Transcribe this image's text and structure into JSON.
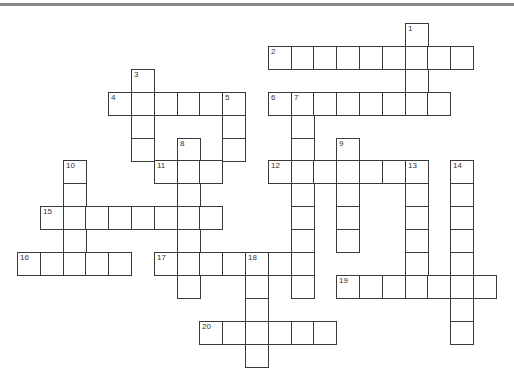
{
  "puzzle": {
    "grid": {
      "origin_x": 17,
      "origin_y": 23,
      "cell_w": 22.8,
      "cell_h": 22.9
    },
    "colors": {
      "border": "#3a3a3a",
      "background": "#ffffff",
      "top_rule": "#8a8a8a"
    },
    "entries": [
      {
        "number": "1",
        "direction": "down",
        "col": 17,
        "row": 0,
        "length": 4
      },
      {
        "number": "2",
        "direction": "across",
        "col": 11,
        "row": 1,
        "length": 9
      },
      {
        "number": "3",
        "direction": "down",
        "col": 5,
        "row": 2,
        "length": 4
      },
      {
        "number": "4",
        "direction": "across",
        "col": 4,
        "row": 3,
        "length": 6
      },
      {
        "number": "5",
        "direction": "down",
        "col": 9,
        "row": 3,
        "length": 3
      },
      {
        "number": "6",
        "direction": "across",
        "col": 11,
        "row": 3,
        "length": 8
      },
      {
        "number": "7",
        "direction": "down",
        "col": 12,
        "row": 3,
        "length": 9
      },
      {
        "number": "8",
        "direction": "down",
        "col": 7,
        "row": 5,
        "length": 7
      },
      {
        "number": "9",
        "direction": "down",
        "col": 14,
        "row": 5,
        "length": 5
      },
      {
        "number": "10",
        "direction": "down",
        "col": 2,
        "row": 6,
        "length": 5
      },
      {
        "number": "11",
        "direction": "across",
        "col": 6,
        "row": 6,
        "length": 3
      },
      {
        "number": "12",
        "direction": "across",
        "col": 11,
        "row": 6,
        "length": 7
      },
      {
        "number": "13",
        "direction": "down",
        "col": 17,
        "row": 6,
        "length": 6
      },
      {
        "number": "14",
        "direction": "down",
        "col": 19,
        "row": 6,
        "length": 8
      },
      {
        "number": "15",
        "direction": "across",
        "col": 1,
        "row": 8,
        "length": 8
      },
      {
        "number": "16",
        "direction": "across",
        "col": 0,
        "row": 10,
        "length": 5
      },
      {
        "number": "17",
        "direction": "across",
        "col": 6,
        "row": 10,
        "length": 7
      },
      {
        "number": "18",
        "direction": "down",
        "col": 10,
        "row": 10,
        "length": 5
      },
      {
        "number": "19",
        "direction": "across",
        "col": 14,
        "row": 11,
        "length": 7
      },
      {
        "number": "20",
        "direction": "across",
        "col": 8,
        "row": 13,
        "length": 6
      }
    ]
  }
}
